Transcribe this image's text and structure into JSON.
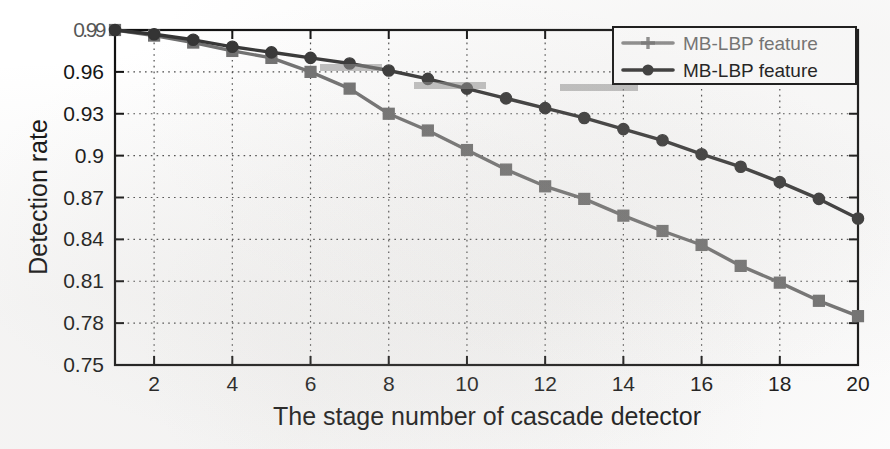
{
  "figure": {
    "background": "#ffffff",
    "plot_border_color": "#111111"
  },
  "axes": {
    "ylabel": "Detection rate",
    "xlabel": "The stage number of cascade detector",
    "yticks": [
      "0.99",
      "0.96",
      "0.93",
      "0.9",
      "0.87",
      "0.84",
      "0.81",
      "0.78",
      "0.75"
    ],
    "xticks": [
      "2",
      "4",
      "6",
      "8",
      "10",
      "12",
      "14",
      "16",
      "18",
      "20"
    ],
    "top_tick_note": "top y tick label 0.99 is degraded/overprinted in the scan"
  },
  "legend": {
    "position": "top-right",
    "entries": [
      {
        "label": "MB-LBP feature",
        "color": "#6f6f6f",
        "marker": "plus",
        "degraded": true
      },
      {
        "label": "MB-LBP feature",
        "color": "#343434",
        "marker": "circle",
        "degraded": false
      }
    ]
  },
  "chart_data": {
    "type": "line",
    "title": "",
    "xlabel": "The stage number of cascade detector",
    "ylabel": "Detection rate",
    "xlim": [
      1,
      20
    ],
    "ylim": [
      0.75,
      0.99
    ],
    "grid": true,
    "grid_style": "dotted",
    "legend_position": "upper right",
    "x": [
      1,
      2,
      3,
      4,
      5,
      6,
      7,
      8,
      9,
      10,
      11,
      12,
      13,
      14,
      15,
      16,
      17,
      18,
      19,
      20
    ],
    "series": [
      {
        "name": "MB-LBP feature",
        "color": "#343434",
        "marker": "circle",
        "values": [
          0.99,
          0.987,
          0.983,
          0.978,
          0.974,
          0.97,
          0.966,
          0.961,
          0.955,
          0.948,
          0.941,
          0.934,
          0.927,
          0.919,
          0.911,
          0.901,
          0.892,
          0.881,
          0.869,
          0.855
        ]
      },
      {
        "name": "MB-LBP feature",
        "color": "#6f6f6f",
        "marker": "square",
        "values": [
          0.99,
          0.986,
          0.981,
          0.975,
          0.97,
          0.96,
          0.948,
          0.93,
          0.918,
          0.904,
          0.89,
          0.878,
          0.869,
          0.857,
          0.846,
          0.836,
          0.821,
          0.809,
          0.796,
          0.785
        ]
      }
    ]
  }
}
